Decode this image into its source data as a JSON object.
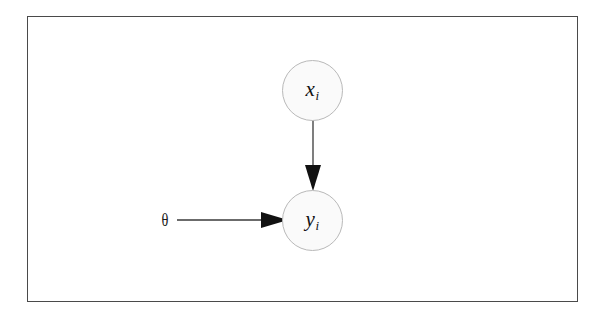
{
  "figure": {
    "type": "graphical-model-diagram",
    "background_color": "#ffffff",
    "frame": {
      "border_color": "#4a4a4a",
      "fill_color": "#ffffff"
    },
    "nodes": [
      {
        "id": "x",
        "variable": "x",
        "subscript": "i",
        "label": "x",
        "shape": "circle",
        "fill_color": "#fafafa",
        "stroke_color": "#b9b9b9",
        "center_x": 312,
        "center_y": 90
      },
      {
        "id": "y",
        "variable": "y",
        "subscript": "i",
        "label": "y",
        "shape": "circle",
        "fill_color": "#fafafa",
        "stroke_color": "#b9b9b9",
        "center_x": 312,
        "center_y": 220
      }
    ],
    "parameters": [
      {
        "id": "theta",
        "label": "θ",
        "center_x": 164,
        "center_y": 220
      }
    ],
    "edges": [
      {
        "id": "x-to-y",
        "from": "x",
        "to": "y",
        "orientation": "vertical",
        "arrow_color": "#111111"
      },
      {
        "id": "theta-to-y",
        "from": "theta",
        "to": "y",
        "orientation": "horizontal",
        "arrow_color": "#111111"
      }
    ]
  }
}
